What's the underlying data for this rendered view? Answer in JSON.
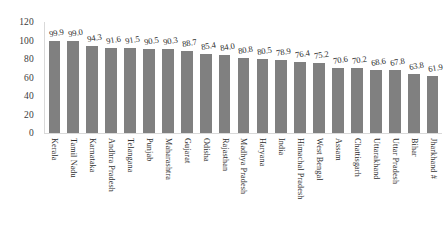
{
  "chart_data": {
    "type": "bar",
    "title": "",
    "subtitle": "",
    "xlabel": "",
    "ylabel": "",
    "ylim": [
      0,
      120
    ],
    "yticks": [
      0,
      20,
      40,
      60,
      80,
      100,
      120
    ],
    "grid": false,
    "legend": "none",
    "bar_color": "#808080",
    "categories": [
      "Kerala",
      "Tamil Nadu",
      "Karnataka",
      "Andhra Pradesh",
      "Telangana",
      "Punjab",
      "Maharashtra",
      "Gujarat",
      "Odisha",
      "Rajasthan",
      "Madhya Pradesh",
      "Haryana",
      "India",
      "Himachal Pradesh",
      "West Bengal",
      "Assam",
      "Chattisgarh",
      "Uttarakhand",
      "Uttar Pradesh",
      "Bihar",
      "Jharkhand #"
    ],
    "values": [
      99.9,
      99.0,
      94.3,
      91.6,
      91.5,
      90.5,
      90.3,
      88.7,
      85.4,
      84.0,
      80.8,
      80.5,
      78.9,
      76.4,
      75.2,
      70.6,
      70.2,
      68.6,
      67.8,
      63.8,
      61.9
    ],
    "value_labels": [
      "99.9",
      "99.0",
      "94.3",
      "91.6",
      "91.5",
      "90.5",
      "90.3",
      "88.7",
      "85.4",
      "84.0",
      "80.8",
      "80.5",
      "78.9",
      "76.4",
      "75.2",
      "70.6",
      "70.2",
      "68.6",
      "67.8",
      "63.8",
      "61.9"
    ],
    "ytick_labels": [
      "0",
      "20",
      "40",
      "60",
      "80",
      "100",
      "120"
    ]
  }
}
